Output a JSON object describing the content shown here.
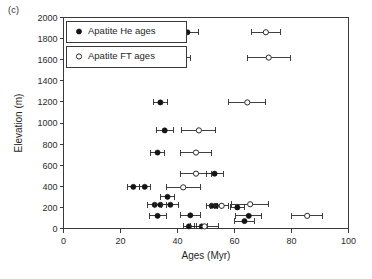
{
  "figure": {
    "panel_label": "(c)"
  },
  "legend": {
    "position": "top-left-inside",
    "entries": [
      {
        "label": "Apatite He ages",
        "marker": "filled-circle",
        "color": "#141414"
      },
      {
        "label": "Apatite FT ages",
        "marker": "open-circle",
        "color": "#2a2a2a"
      }
    ]
  },
  "chart_data": {
    "type": "scatter",
    "title": "",
    "xlabel": "Ages (Myr)",
    "ylabel": "Elevation (m)",
    "xlim": [
      0,
      100
    ],
    "ylim": [
      0,
      2000
    ],
    "xticks": [
      0,
      20,
      40,
      60,
      80,
      100
    ],
    "yticks": [
      0,
      200,
      400,
      600,
      800,
      1000,
      1200,
      1400,
      1600,
      1800,
      2000
    ],
    "grid": false,
    "error_bars": "horizontal-x",
    "series": [
      {
        "name": "Apatite He ages",
        "marker": "filled-circle",
        "color": "#141414",
        "points": [
          {
            "x": 43.5,
            "y": 1860,
            "xerr": 4.0
          },
          {
            "x": 41.0,
            "y": 1620,
            "xerr": 3.5
          },
          {
            "x": 34.0,
            "y": 1195,
            "xerr": 2.5
          },
          {
            "x": 35.5,
            "y": 930,
            "xerr": 3.0
          },
          {
            "x": 33.0,
            "y": 720,
            "xerr": 2.5
          },
          {
            "x": 53.0,
            "y": 520,
            "xerr": 3.0
          },
          {
            "x": 24.5,
            "y": 395,
            "xerr": 2.0
          },
          {
            "x": 28.5,
            "y": 395,
            "xerr": 2.0
          },
          {
            "x": 36.5,
            "y": 300,
            "xerr": 2.5
          },
          {
            "x": 32.0,
            "y": 225,
            "xerr": 2.5
          },
          {
            "x": 34.0,
            "y": 225,
            "xerr": 2.0
          },
          {
            "x": 37.5,
            "y": 225,
            "xerr": 3.0
          },
          {
            "x": 52.0,
            "y": 215,
            "xerr": 2.0
          },
          {
            "x": 53.5,
            "y": 215,
            "xerr": 2.0
          },
          {
            "x": 61.0,
            "y": 200,
            "xerr": 2.5
          },
          {
            "x": 33.0,
            "y": 120,
            "xerr": 3.0
          },
          {
            "x": 44.5,
            "y": 125,
            "xerr": 3.5
          },
          {
            "x": 65.0,
            "y": 120,
            "xerr": 4.5
          },
          {
            "x": 63.5,
            "y": 70,
            "xerr": 3.5
          },
          {
            "x": 44.0,
            "y": 20,
            "xerr": 2.0
          },
          {
            "x": 48.5,
            "y": 20,
            "xerr": 2.0
          }
        ]
      },
      {
        "name": "Apatite FT ages",
        "marker": "open-circle",
        "color": "#2a2a2a",
        "points": [
          {
            "x": 71.0,
            "y": 1860,
            "xerr": 5.0
          },
          {
            "x": 72.0,
            "y": 1620,
            "xerr": 7.5
          },
          {
            "x": 64.5,
            "y": 1195,
            "xerr": 6.5
          },
          {
            "x": 47.5,
            "y": 930,
            "xerr": 6.0
          },
          {
            "x": 46.5,
            "y": 720,
            "xerr": 5.5
          },
          {
            "x": 46.5,
            "y": 520,
            "xerr": 5.5
          },
          {
            "x": 42.0,
            "y": 390,
            "xerr": 6.0
          },
          {
            "x": 65.5,
            "y": 230,
            "xerr": 6.5
          },
          {
            "x": 55.5,
            "y": 215,
            "xerr": 2.5
          },
          {
            "x": 85.5,
            "y": 120,
            "xerr": 5.5
          },
          {
            "x": 49.5,
            "y": 20,
            "xerr": 5.0
          }
        ]
      }
    ]
  }
}
